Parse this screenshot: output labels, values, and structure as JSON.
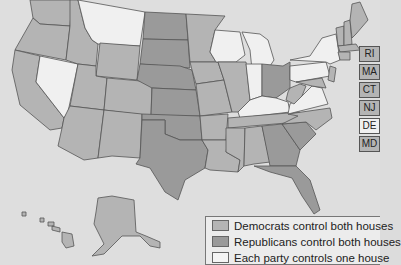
{
  "map": {
    "title": "State legislature party control",
    "colors": {
      "democrats": "#b4b4b4",
      "republicans": "#9a9a9a",
      "split": "#f0f0f0",
      "background": "#dedede"
    }
  },
  "small_states": [
    {
      "abbr": "RI",
      "control": "democrats"
    },
    {
      "abbr": "MA",
      "control": "democrats"
    },
    {
      "abbr": "CT",
      "control": "democrats"
    },
    {
      "abbr": "NJ",
      "control": "democrats"
    },
    {
      "abbr": "DE",
      "control": "split"
    },
    {
      "abbr": "MD",
      "control": "democrats"
    }
  ],
  "legend": {
    "items": [
      {
        "label": "Democrats control both houses",
        "color": "#b4b4b4"
      },
      {
        "label": "Republicans control both houses",
        "color": "#9a9a9a"
      },
      {
        "label": "Each party controls one house",
        "color": "#f4f4f4"
      }
    ]
  }
}
